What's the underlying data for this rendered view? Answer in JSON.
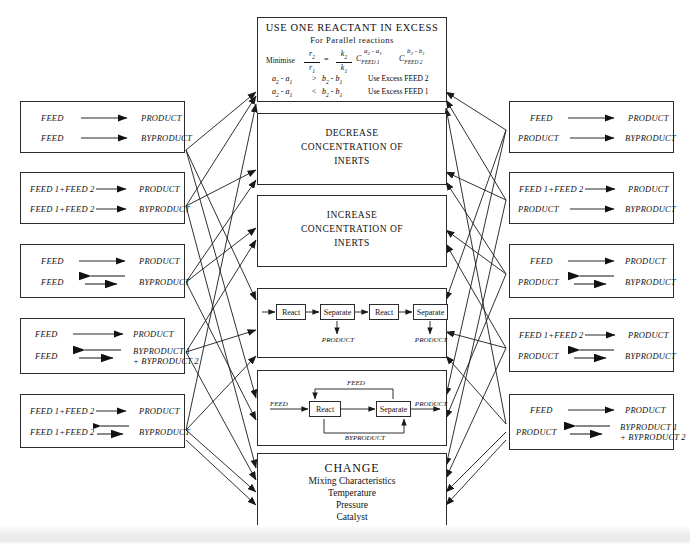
{
  "diagram": {
    "center_boxes": [
      {
        "id": "excess-reactant",
        "title": "USE ONE REACTANT IN EXCESS",
        "subtitle": "For Parallel reactions",
        "formula": {
          "lead": "Minimise",
          "lhs_num": "r",
          "lhs_num_sub": "2",
          "lhs_den": "r",
          "lhs_den_sub": "1",
          "eq": "=",
          "k_num": "k",
          "k_num_sub": "2",
          "k_den": "k",
          "k_den_sub": "1",
          "c1": "C",
          "c1_sub": "FEED 1",
          "c1_exp": "a2 - a1",
          "c2": "C",
          "c2_sub": "FEED 2",
          "c2_exp": "b2 - b1"
        },
        "conditions": [
          {
            "expr_left": "a2 - a1",
            "op": ">",
            "expr_right": "b2 - b1",
            "action": "Use Excess FEED 2"
          },
          {
            "expr_left": "a2 - a1",
            "op": "<",
            "expr_right": "b2 - b1",
            "action": "Use Excess FEED 1"
          }
        ]
      },
      {
        "id": "decrease-inerts",
        "lines": [
          "DECREASE",
          "CONCENTRATION OF",
          "INERTS"
        ]
      },
      {
        "id": "increase-inerts",
        "lines": [
          "INCREASE",
          "CONCENTRATION OF",
          "INERTS"
        ]
      },
      {
        "id": "staged-react-separate",
        "units": [
          "React",
          "Separate",
          "React",
          "Separate"
        ],
        "outputs": [
          "PRODUCT",
          "PRODUCT"
        ]
      },
      {
        "id": "recycle-flowsheet",
        "units": [
          "React",
          "Separate"
        ],
        "inlet": "FEED",
        "outlet": "PRODUCT",
        "recycle_top": "FEED",
        "recycle_bottom": "BYPRODUCT"
      },
      {
        "id": "change-conditions",
        "title": "CHANGE",
        "items": [
          "Mixing Characteristics",
          "Temperature",
          "Pressure",
          "Catalyst"
        ]
      }
    ],
    "left_boxes": [
      {
        "id": "left-1",
        "rows": [
          {
            "reactants": "FEED",
            "arrow": "single-right",
            "products": "PRODUCT"
          },
          {
            "reactants": "FEED",
            "arrow": "single-right",
            "products": "BYPRODUCT"
          }
        ]
      },
      {
        "id": "left-2",
        "rows": [
          {
            "reactants": "FEED 1+FEED 2",
            "arrow": "single-right",
            "products": "PRODUCT"
          },
          {
            "reactants": "FEED 1+FEED 2",
            "arrow": "single-right",
            "products": "BYPRODUCT"
          }
        ]
      },
      {
        "id": "left-3",
        "rows": [
          {
            "reactants": "FEED",
            "arrow": "single-right",
            "products": "PRODUCT"
          },
          {
            "reactants": "FEED",
            "arrow": "reversible",
            "products": "BYPRODUCT"
          }
        ]
      },
      {
        "id": "left-4",
        "rows": [
          {
            "reactants": "FEED",
            "arrow": "single-right",
            "products": "PRODUCT"
          },
          {
            "reactants": "FEED",
            "arrow": "reversible",
            "products": "BYPRODUCT 1",
            "products_line2": "+ BYPRODUCT 2"
          }
        ]
      },
      {
        "id": "left-5",
        "rows": [
          {
            "reactants": "FEED 1+FEED 2",
            "arrow": "single-right",
            "products": "PRODUCT"
          },
          {
            "reactants": "FEED 1+FEED 2",
            "arrow": "reversible",
            "products": "BYPRODUCT"
          }
        ]
      }
    ],
    "right_boxes": [
      {
        "id": "right-1",
        "rows": [
          {
            "reactants": "FEED",
            "arrow": "single-right",
            "products": "PRODUCT"
          },
          {
            "reactants": "PRODUCT",
            "arrow": "single-right",
            "products": "BYPRODUCT"
          }
        ]
      },
      {
        "id": "right-2",
        "rows": [
          {
            "reactants": "FEED 1+FEED 2",
            "arrow": "single-right",
            "products": "PRODUCT"
          },
          {
            "reactants": "PRODUCT",
            "arrow": "single-right",
            "products": "BYPRODUCT"
          }
        ]
      },
      {
        "id": "right-3",
        "rows": [
          {
            "reactants": "FEED",
            "arrow": "single-right",
            "products": "PRODUCT"
          },
          {
            "reactants": "PRODUCT",
            "arrow": "reversible",
            "products": "BYPRODUCT"
          }
        ]
      },
      {
        "id": "right-4",
        "rows": [
          {
            "reactants": "FEED 1+FEED 2",
            "arrow": "single-right",
            "products": "PRODUCT"
          },
          {
            "reactants": "PRODUCT",
            "arrow": "reversible",
            "products": "BYPRODUCT"
          }
        ]
      },
      {
        "id": "right-5",
        "rows": [
          {
            "reactants": "FEED",
            "arrow": "single-right",
            "products": "PRODUCT"
          },
          {
            "reactants": "PRODUCT",
            "arrow": "reversible",
            "products": "BYPRODUCT 1",
            "products_line2": "+ BYPRODUCT 2"
          }
        ]
      }
    ],
    "colors": {
      "line": "#2b2b2b",
      "text": "#111111",
      "background": "#ffffff"
    }
  }
}
